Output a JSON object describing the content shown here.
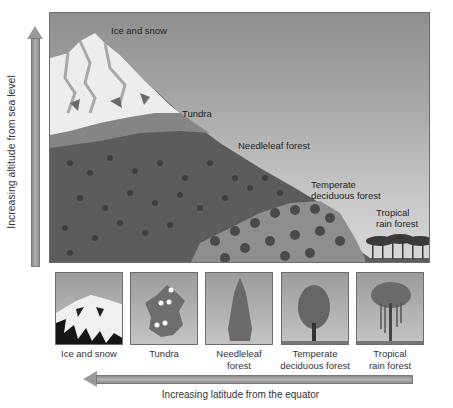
{
  "diagram": {
    "vertical_axis": {
      "label": "Increasing altitude from sea level",
      "direction": "up"
    },
    "horizontal_axis": {
      "label": "Increasing latitude from the equator",
      "direction": "left"
    },
    "mountain_zones": [
      {
        "label": "Ice and snow"
      },
      {
        "label": "Tundra"
      },
      {
        "label": "Needleleaf forest"
      },
      {
        "label_line1": "Temperate",
        "label_line2": "deciduous forest"
      },
      {
        "label_line1": "Tropical",
        "label_line2": "rain forest"
      }
    ],
    "biome_thumbnails": [
      {
        "label_line1": "Ice and snow",
        "label_line2": "",
        "icon": "snowy-peak-icon"
      },
      {
        "label_line1": "Tundra",
        "label_line2": "",
        "icon": "tundra-flower-icon"
      },
      {
        "label_line1": "Needleleaf",
        "label_line2": "forest",
        "icon": "conifer-tree-icon"
      },
      {
        "label_line1": "Temperate",
        "label_line2": "deciduous forest",
        "icon": "deciduous-tree-icon"
      },
      {
        "label_line1": "Tropical",
        "label_line2": "rain forest",
        "icon": "rainforest-tree-icon"
      }
    ],
    "colors": {
      "sky_top": "#8f8f8f",
      "sky_bottom": "#d8d8d8",
      "forest_dark": "#3f3f3f",
      "snow": "#f2f2f2",
      "arrow": "#9a9a9a"
    }
  }
}
